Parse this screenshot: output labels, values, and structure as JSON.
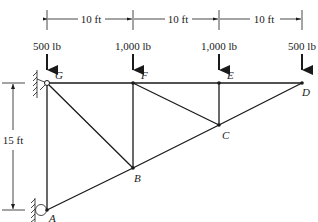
{
  "diagram": {
    "type": "truss",
    "dimensions": {
      "horizontal": [
        {
          "label": "10 ft",
          "from": "G",
          "to": "F"
        },
        {
          "label": "10 ft",
          "from": "F",
          "to": "E"
        },
        {
          "label": "10 ft",
          "from": "E",
          "to": "D"
        }
      ],
      "vertical": {
        "label": "15 ft",
        "from": "G",
        "to": "A"
      }
    },
    "loads": [
      {
        "node": "G",
        "label": "500 lb"
      },
      {
        "node": "F",
        "label": "1,000 lb"
      },
      {
        "node": "E",
        "label": "1,000 lb"
      },
      {
        "node": "D",
        "label": "500 lb"
      }
    ],
    "nodes": {
      "G": {
        "label": "G"
      },
      "F": {
        "label": "F"
      },
      "E": {
        "label": "E"
      },
      "D": {
        "label": "D"
      },
      "C": {
        "label": "C"
      },
      "B": {
        "label": "B"
      },
      "A": {
        "label": "A"
      }
    },
    "members": [
      "G-F",
      "F-E",
      "E-D",
      "G-A",
      "A-B",
      "B-C",
      "C-D",
      "G-B",
      "F-B",
      "F-C",
      "E-C"
    ],
    "supports": [
      {
        "node": "G",
        "type": "pin-wall"
      },
      {
        "node": "A",
        "type": "roller-wall"
      }
    ],
    "colors": {
      "line": "#1a1a1a",
      "background": "#ffffff"
    }
  }
}
